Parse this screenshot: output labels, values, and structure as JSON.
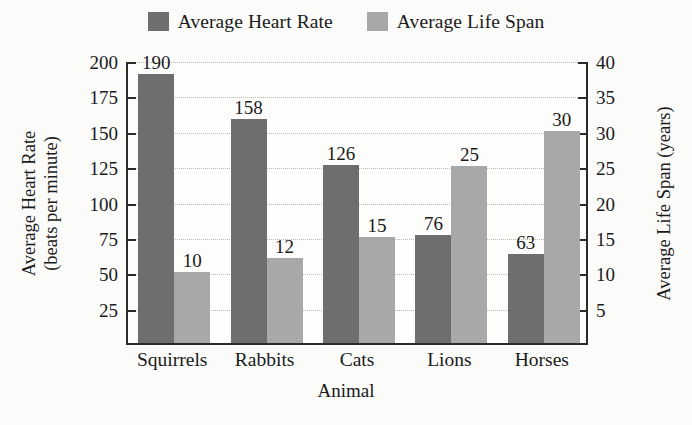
{
  "chart_data": {
    "type": "bar",
    "title": "",
    "categories": [
      "Squirrels",
      "Rabbits",
      "Cats",
      "Lions",
      "Horses"
    ],
    "series": [
      {
        "name": "Average Heart Rate",
        "values": [
          190,
          158,
          126,
          76,
          63
        ],
        "axis": "left",
        "color": "#6e6e6e"
      },
      {
        "name": "Average Life Span",
        "values": [
          10,
          12,
          15,
          25,
          30
        ],
        "axis": "right",
        "color": "#a8a8a8"
      }
    ],
    "xlabel": "Animal",
    "ylabel": "Average Heart Rate (beats per minute)",
    "ylabel_line1": "Average Heart Rate",
    "ylabel_line2": "(beats per minute)",
    "y2label": "Average Life Span (years)",
    "ylim": [
      0,
      200
    ],
    "y2lim": [
      0,
      40
    ],
    "yticks": [
      25,
      50,
      75,
      100,
      125,
      150,
      175,
      200
    ],
    "y2ticks": [
      5,
      10,
      15,
      20,
      25,
      30,
      35,
      40
    ],
    "ytick_labels": [
      "25",
      "50",
      "75",
      "100",
      "125",
      "150",
      "175",
      "200"
    ],
    "y2tick_labels": [
      "5",
      "10",
      "15",
      "20",
      "25",
      "30",
      "35",
      "40"
    ],
    "grid": true,
    "grid_style": "dotted",
    "legend_position": "top-center",
    "data_labels": true,
    "background": "#fbfbfa"
  },
  "legend": {
    "entries": [
      {
        "label": "Average Heart Rate",
        "swatch": "legend-swatch-heart-rate",
        "color": "#6e6e6e"
      },
      {
        "label": "Average Life Span",
        "swatch": "legend-swatch-life-span",
        "color": "#a8a8a8"
      }
    ]
  }
}
